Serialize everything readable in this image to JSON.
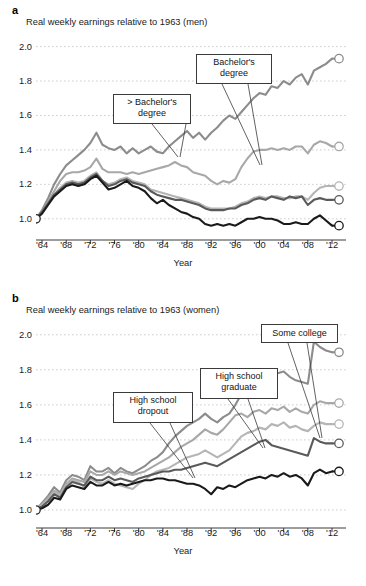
{
  "figure": {
    "panels": [
      {
        "letter": "a",
        "title": "Real weekly earnings relative to 1963 (men)",
        "xlabel": "Year",
        "callouts": [
          {
            "text": "> Bachelor's degree",
            "line1": "> Bachelor's",
            "line2": "degree"
          },
          {
            "text": "Bachelor's degree",
            "line1": "Bachelor's",
            "line2": "degree"
          }
        ]
      },
      {
        "letter": "b",
        "title": "Real weekly earnings relative to 1963 (women)",
        "xlabel": "Year",
        "callouts": [
          {
            "text": "High school dropout",
            "line1": "High school",
            "line2": "dropout"
          },
          {
            "text": "High school graduate",
            "line1": "High school",
            "line2": "graduate"
          },
          {
            "text": "Some college",
            "line1": "Some college",
            "line2": ""
          }
        ]
      }
    ],
    "caption": ""
  },
  "chart_data": [
    {
      "type": "line",
      "panel": "a",
      "title": "Real weekly earnings relative to 1963 (men)",
      "xlabel": "Year",
      "ylabel": "",
      "xlim": [
        1963,
        2012
      ],
      "ylim": [
        0.9,
        2.05
      ],
      "yticks": [
        1.0,
        1.2,
        1.4,
        1.6,
        1.8,
        2.0
      ],
      "ytick_labels": [
        "1.0",
        "1.2",
        "1.4",
        "1.6",
        "1.8",
        "2.0"
      ],
      "xticks": [
        1964,
        1968,
        1972,
        1976,
        1980,
        1984,
        1988,
        1992,
        1996,
        2000,
        2004,
        2008,
        2012
      ],
      "xtick_labels": [
        "'64",
        "'68",
        "'72",
        "'76",
        "'80",
        "'84",
        "'88",
        "'92",
        "'96",
        "'00",
        "'04",
        "'08",
        "'12"
      ],
      "grid": "horizontal-dotted",
      "legend": "callout-annotations",
      "x": [
        1963,
        1964,
        1965,
        1966,
        1967,
        1968,
        1969,
        1970,
        1971,
        1972,
        1973,
        1974,
        1975,
        1976,
        1977,
        1978,
        1979,
        1980,
        1981,
        1982,
        1983,
        1984,
        1985,
        1986,
        1987,
        1988,
        1989,
        1990,
        1991,
        1992,
        1993,
        1994,
        1995,
        1996,
        1997,
        1998,
        1999,
        2000,
        2001,
        2002,
        2003,
        2004,
        2005,
        2006,
        2007,
        2008,
        2009,
        2010,
        2011,
        2012
      ],
      "series": [
        {
          "name": "> Bachelor's degree",
          "color": "#8c8c8c",
          "end_value": 1.93,
          "values": [
            1.0,
            1.05,
            1.12,
            1.2,
            1.26,
            1.31,
            1.34,
            1.37,
            1.4,
            1.44,
            1.5,
            1.43,
            1.41,
            1.4,
            1.42,
            1.38,
            1.41,
            1.38,
            1.4,
            1.42,
            1.39,
            1.38,
            1.42,
            1.45,
            1.48,
            1.51,
            1.47,
            1.5,
            1.46,
            1.5,
            1.53,
            1.57,
            1.6,
            1.58,
            1.62,
            1.66,
            1.7,
            1.73,
            1.72,
            1.77,
            1.76,
            1.8,
            1.78,
            1.82,
            1.84,
            1.78,
            1.86,
            1.88,
            1.9,
            1.93
          ]
        },
        {
          "name": "Bachelor's degree",
          "color": "#a8a8a8",
          "end_value": 1.42,
          "values": [
            1.0,
            1.04,
            1.1,
            1.16,
            1.22,
            1.26,
            1.27,
            1.27,
            1.28,
            1.3,
            1.35,
            1.29,
            1.27,
            1.27,
            1.27,
            1.26,
            1.27,
            1.26,
            1.27,
            1.28,
            1.29,
            1.3,
            1.31,
            1.33,
            1.31,
            1.3,
            1.27,
            1.26,
            1.25,
            1.22,
            1.2,
            1.22,
            1.21,
            1.23,
            1.3,
            1.35,
            1.39,
            1.4,
            1.4,
            1.41,
            1.4,
            1.41,
            1.4,
            1.42,
            1.42,
            1.38,
            1.43,
            1.45,
            1.44,
            1.42
          ]
        },
        {
          "name": "Some college",
          "color": "#b5b5b5",
          "end_value": 1.19,
          "values": [
            1.0,
            1.04,
            1.09,
            1.14,
            1.18,
            1.21,
            1.22,
            1.21,
            1.22,
            1.25,
            1.27,
            1.22,
            1.2,
            1.21,
            1.23,
            1.24,
            1.22,
            1.21,
            1.2,
            1.17,
            1.16,
            1.15,
            1.14,
            1.13,
            1.12,
            1.11,
            1.1,
            1.09,
            1.07,
            1.06,
            1.06,
            1.06,
            1.06,
            1.07,
            1.09,
            1.1,
            1.12,
            1.13,
            1.12,
            1.13,
            1.13,
            1.12,
            1.12,
            1.13,
            1.13,
            1.11,
            1.15,
            1.18,
            1.19,
            1.19
          ]
        },
        {
          "name": "High school graduate",
          "color": "#5a5a5a",
          "end_value": 1.11,
          "values": [
            1.0,
            1.04,
            1.09,
            1.14,
            1.17,
            1.2,
            1.21,
            1.2,
            1.21,
            1.24,
            1.26,
            1.22,
            1.19,
            1.2,
            1.22,
            1.23,
            1.21,
            1.2,
            1.19,
            1.16,
            1.14,
            1.13,
            1.12,
            1.11,
            1.11,
            1.1,
            1.09,
            1.08,
            1.06,
            1.05,
            1.05,
            1.05,
            1.06,
            1.06,
            1.08,
            1.09,
            1.11,
            1.12,
            1.11,
            1.13,
            1.12,
            1.11,
            1.13,
            1.12,
            1.13,
            1.08,
            1.11,
            1.12,
            1.11,
            1.11
          ]
        },
        {
          "name": "High school dropout",
          "color": "#1a1a1a",
          "end_value": 0.96,
          "values": [
            1.0,
            1.03,
            1.08,
            1.13,
            1.16,
            1.19,
            1.2,
            1.19,
            1.2,
            1.23,
            1.25,
            1.21,
            1.17,
            1.18,
            1.2,
            1.22,
            1.19,
            1.18,
            1.16,
            1.12,
            1.09,
            1.11,
            1.08,
            1.06,
            1.04,
            1.03,
            1.01,
            1.0,
            0.97,
            0.96,
            0.97,
            0.96,
            0.97,
            0.96,
            0.98,
            1.0,
            1.0,
            1.01,
            1.0,
            1.0,
            0.99,
            0.97,
            0.97,
            0.98,
            0.97,
            0.97,
            1.0,
            1.02,
            0.99,
            0.96
          ]
        }
      ]
    },
    {
      "type": "line",
      "panel": "b",
      "title": "Real weekly earnings relative to 1963 (women)",
      "xlabel": "Year",
      "ylabel": "",
      "xlim": [
        1963,
        2012
      ],
      "ylim": [
        0.92,
        2.05
      ],
      "yticks": [
        1.0,
        1.2,
        1.4,
        1.6,
        1.8,
        2.0
      ],
      "ytick_labels": [
        "1.0",
        "1.2",
        "1.4",
        "1.6",
        "1.8",
        "2.0"
      ],
      "xticks": [
        1964,
        1968,
        1972,
        1976,
        1980,
        1984,
        1988,
        1992,
        1996,
        2000,
        2004,
        2008,
        2012
      ],
      "xtick_labels": [
        "'64",
        "'68",
        "'72",
        "'76",
        "'80",
        "'84",
        "'88",
        "'92",
        "'96",
        "'00",
        "'04",
        "'08",
        "'12"
      ],
      "grid": "horizontal-dotted",
      "legend": "callout-annotations",
      "x": [
        1963,
        1964,
        1965,
        1966,
        1967,
        1968,
        1969,
        1970,
        1971,
        1972,
        1973,
        1974,
        1975,
        1976,
        1977,
        1978,
        1979,
        1980,
        1981,
        1982,
        1983,
        1984,
        1985,
        1986,
        1987,
        1988,
        1989,
        1990,
        1991,
        1992,
        1993,
        1994,
        1995,
        1996,
        1997,
        1998,
        1999,
        2000,
        2001,
        2002,
        2003,
        2004,
        2005,
        2006,
        2007,
        2008,
        2009,
        2010,
        2011,
        2012
      ],
      "series": [
        {
          "name": "> Bachelor's degree",
          "color": "#8c8c8c",
          "end_value": 1.9,
          "values": [
            1.0,
            1.04,
            1.08,
            1.13,
            1.1,
            1.17,
            1.2,
            1.19,
            1.17,
            1.25,
            1.22,
            1.22,
            1.24,
            1.21,
            1.24,
            1.22,
            1.21,
            1.23,
            1.25,
            1.28,
            1.3,
            1.33,
            1.38,
            1.42,
            1.45,
            1.48,
            1.5,
            1.52,
            1.55,
            1.52,
            1.5,
            1.53,
            1.55,
            1.6,
            1.66,
            1.7,
            1.72,
            1.74,
            1.77,
            1.79,
            1.78,
            1.79,
            1.76,
            1.74,
            1.73,
            1.72,
            1.96,
            1.93,
            1.91,
            1.9
          ]
        },
        {
          "name": "Bachelor's degree",
          "color": "#a8a8a8",
          "end_value": 1.61,
          "values": [
            1.0,
            1.03,
            1.07,
            1.11,
            1.09,
            1.15,
            1.18,
            1.17,
            1.16,
            1.22,
            1.2,
            1.2,
            1.22,
            1.2,
            1.22,
            1.21,
            1.2,
            1.21,
            1.22,
            1.24,
            1.26,
            1.28,
            1.3,
            1.33,
            1.36,
            1.38,
            1.4,
            1.43,
            1.46,
            1.44,
            1.43,
            1.46,
            1.5,
            1.54,
            1.55,
            1.53,
            1.56,
            1.57,
            1.55,
            1.58,
            1.57,
            1.59,
            1.56,
            1.58,
            1.56,
            1.55,
            1.6,
            1.62,
            1.61,
            1.61
          ]
        },
        {
          "name": "Some college",
          "color": "#b5b5b5",
          "end_value": 1.49,
          "values": [
            1.0,
            1.03,
            1.06,
            1.1,
            1.08,
            1.14,
            1.17,
            1.16,
            1.13,
            1.18,
            1.16,
            1.15,
            1.17,
            1.15,
            1.14,
            1.13,
            1.12,
            1.15,
            1.17,
            1.2,
            1.22,
            1.23,
            1.24,
            1.26,
            1.28,
            1.3,
            1.31,
            1.32,
            1.34,
            1.32,
            1.3,
            1.32,
            1.34,
            1.38,
            1.42,
            1.44,
            1.45,
            1.47,
            1.46,
            1.49,
            1.48,
            1.5,
            1.47,
            1.48,
            1.46,
            1.45,
            1.48,
            1.5,
            1.49,
            1.49
          ]
        },
        {
          "name": "High school graduate",
          "color": "#5a5a5a",
          "end_value": 1.38,
          "values": [
            1.0,
            1.02,
            1.05,
            1.09,
            1.07,
            1.13,
            1.16,
            1.15,
            1.14,
            1.19,
            1.17,
            1.17,
            1.19,
            1.17,
            1.18,
            1.17,
            1.16,
            1.18,
            1.19,
            1.2,
            1.21,
            1.22,
            1.22,
            1.23,
            1.23,
            1.24,
            1.25,
            1.26,
            1.27,
            1.26,
            1.25,
            1.27,
            1.29,
            1.31,
            1.33,
            1.35,
            1.37,
            1.39,
            1.4,
            1.37,
            1.36,
            1.35,
            1.34,
            1.33,
            1.32,
            1.31,
            1.41,
            1.39,
            1.38,
            1.38
          ]
        },
        {
          "name": "High school dropout",
          "color": "#1a1a1a",
          "end_value": 1.22,
          "values": [
            1.0,
            1.01,
            1.03,
            1.07,
            1.06,
            1.12,
            1.14,
            1.13,
            1.12,
            1.16,
            1.14,
            1.14,
            1.16,
            1.14,
            1.15,
            1.14,
            1.15,
            1.16,
            1.17,
            1.17,
            1.18,
            1.18,
            1.17,
            1.17,
            1.16,
            1.15,
            1.15,
            1.14,
            1.12,
            1.09,
            1.13,
            1.12,
            1.14,
            1.13,
            1.15,
            1.17,
            1.18,
            1.19,
            1.18,
            1.2,
            1.19,
            1.21,
            1.19,
            1.2,
            1.18,
            1.14,
            1.21,
            1.23,
            1.21,
            1.22
          ]
        }
      ]
    }
  ]
}
